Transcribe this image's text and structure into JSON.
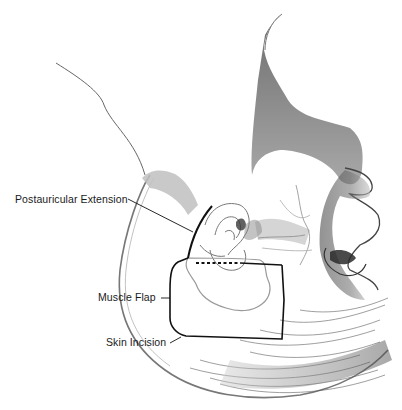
{
  "figure": {
    "labels": [
      {
        "id": "postauricular",
        "text": "Postauricular Extension"
      },
      {
        "id": "muscle",
        "text": "Muscle Flap"
      },
      {
        "id": "skin",
        "text": "Skin Incision"
      }
    ],
    "colors": {
      "line": "#111111",
      "shading": "#555555",
      "flap_outline": "#9a9a9a",
      "background": "#ffffff"
    }
  }
}
